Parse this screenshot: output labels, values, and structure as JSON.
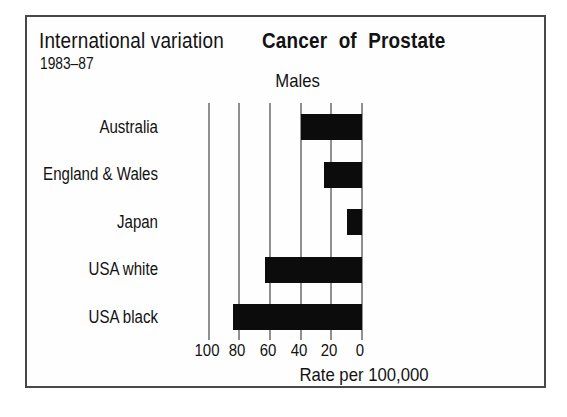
{
  "header": {
    "annotation_title": "International variation",
    "period": "1983–87",
    "title": "Cancer of Prostate",
    "subtitle": "Males"
  },
  "chart_data": {
    "type": "bar",
    "orientation": "horizontal",
    "title": "Cancer of Prostate",
    "subtitle": "Males",
    "annotation": "International variation 1983–87",
    "categories": [
      "Australia",
      "England & Wales",
      "Japan",
      "USA white",
      "USA black"
    ],
    "values": [
      40,
      25,
      10,
      63,
      84
    ],
    "xlabel": "Rate per 100,000",
    "x_ticks": [
      100,
      80,
      60,
      40,
      20,
      0
    ],
    "x_axis_reversed": true,
    "xlim": [
      100,
      0
    ],
    "grid": true,
    "legend": "none",
    "bar_color": "#0c0c0c",
    "gridline_color": "#8f8f8f",
    "text_color": "#121212"
  }
}
